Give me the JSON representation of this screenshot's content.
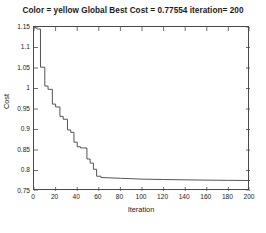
{
  "chart_data": {
    "type": "line",
    "title": "Color = yellow Global Best Cost = 0.77554 iteration= 200",
    "xlabel": "Iteration",
    "ylabel": "Cost",
    "xlim": [
      0,
      200
    ],
    "ylim": [
      0.75,
      1.15
    ],
    "xticks": [
      0,
      20,
      40,
      60,
      80,
      100,
      120,
      140,
      160,
      180,
      200
    ],
    "xtick_labels": [
      "0",
      "20",
      "40",
      "60",
      "80",
      "100",
      "120",
      "140",
      "160",
      "180",
      "200"
    ],
    "yticks": [
      0.75,
      0.8,
      0.85,
      0.9,
      0.95,
      1,
      1.05,
      1.1,
      1.15
    ],
    "ytick_labels": [
      "0.75",
      "0.8",
      "0.85",
      "0.9",
      "0.95",
      "1",
      "1.05",
      "1.1",
      "1.15"
    ],
    "grid": false,
    "legend": null,
    "line_color": "#555555",
    "line_width": 1,
    "series": [
      {
        "name": "Global Best Cost",
        "x": [
          0,
          1,
          2,
          3,
          6,
          6,
          10,
          10,
          13,
          13,
          17,
          17,
          20,
          20,
          24,
          24,
          27,
          27,
          31,
          31,
          34,
          34,
          37,
          37,
          40,
          40,
          43,
          43,
          46,
          46,
          49,
          49,
          52,
          52,
          55,
          55,
          58,
          58,
          62,
          62,
          80,
          100,
          120,
          140,
          160,
          180,
          200
        ],
        "y": [
          1.148,
          1.148,
          1.148,
          1.145,
          1.145,
          1.052,
          1.052,
          1.006,
          1.006,
          0.998,
          0.998,
          0.962,
          0.962,
          0.955,
          0.955,
          0.932,
          0.932,
          0.925,
          0.925,
          0.899,
          0.899,
          0.893,
          0.893,
          0.869,
          0.869,
          0.858,
          0.858,
          0.855,
          0.855,
          0.855,
          0.855,
          0.828,
          0.828,
          0.818,
          0.818,
          0.803,
          0.803,
          0.786,
          0.786,
          0.783,
          0.781,
          0.779,
          0.778,
          0.7772,
          0.7765,
          0.776,
          0.77554
        ]
      }
    ],
    "final_value": 0.77554,
    "final_iteration": 200
  },
  "title_text": {
    "full": "Color = yellow Global Best Cost = 0.77554 iteration= 200"
  }
}
